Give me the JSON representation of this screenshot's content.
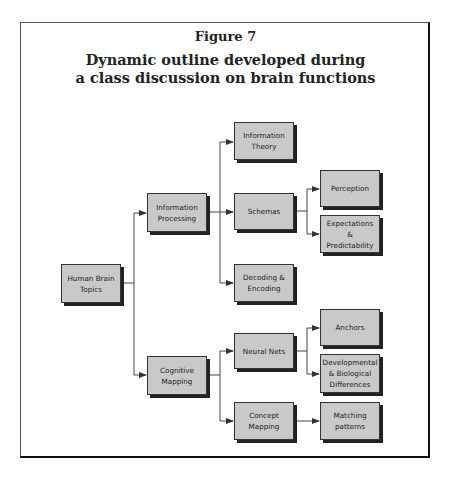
{
  "figure": {
    "label": "Figure 7",
    "title_line1": "Dynamic outline developed during",
    "title_line2": "a class discussion on brain functions"
  },
  "colors": {
    "node_fill": "#c9c9c9",
    "node_shadow": "#222222",
    "line": "#444444"
  },
  "nodes": {
    "root": "Human Brain Topics",
    "info_processing": "Information Processing",
    "cognitive_mapping": "Cognitive Mapping",
    "info_theory": "Information Theory",
    "schemas": "Schemas",
    "decoding": "Decoding & Encoding",
    "perception": "Perception",
    "expectations": "Expectations & Predictability",
    "neural_nets": "Neural Nets",
    "concept_mapping": "Concept Mapping",
    "anchors": "Anchors",
    "developmental": "Developmental & Biological Differences",
    "matching": "Matching patterns"
  },
  "tree": {
    "Human Brain Topics": {
      "Information Processing": {
        "Information Theory": {},
        "Schemas": {
          "Perception": {},
          "Expectations & Predictability": {}
        },
        "Decoding & Encoding": {}
      },
      "Cognitive Mapping": {
        "Neural Nets": {
          "Anchors": {},
          "Developmental & Biological Differences": {}
        },
        "Concept Mapping": {
          "Matching patterns": {}
        }
      }
    }
  }
}
